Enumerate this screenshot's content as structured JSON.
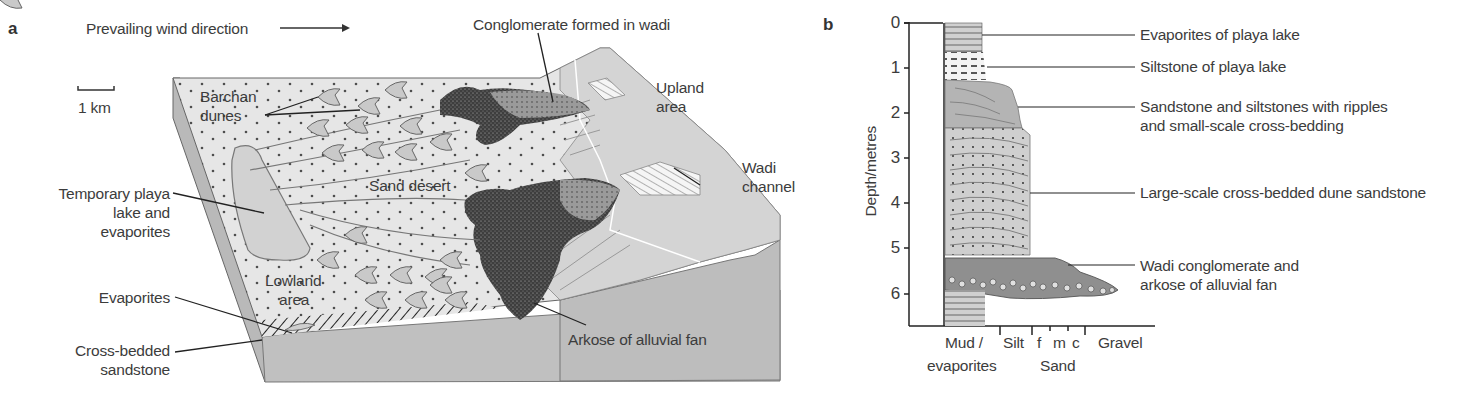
{
  "panel_a": {
    "letter": "a",
    "wind_label": "Prevailing wind direction",
    "scale_label": "1 km",
    "labels": {
      "barchan": [
        "Barchan",
        "dunes"
      ],
      "temporary_playa": [
        "Temporary playa",
        "lake and",
        "evaporites"
      ],
      "sand_desert": "Sand desert",
      "lowland": [
        "Lowland",
        "area"
      ],
      "evaporites": "Evaporites",
      "cross_bedded": [
        "Cross-bedded",
        "sandstone"
      ],
      "conglomerate": "Conglomerate formed in wadi",
      "upland": [
        "Upland",
        "area"
      ],
      "wadi_channel": [
        "Wadi",
        "channel"
      ],
      "arkose": "Arkose of alluvial fan"
    }
  },
  "panel_b": {
    "letter": "b",
    "ylabel": "Depth/metres",
    "depth_ticks": [
      "0",
      "1",
      "2",
      "3",
      "4",
      "5",
      "6"
    ],
    "grain_axis": {
      "mud": "Mud /",
      "evaporites": "evaporites",
      "silt": "Silt",
      "f": "f",
      "m": "m",
      "c": "c",
      "sand": "Sand",
      "gravel": "Gravel"
    },
    "units": [
      {
        "label": "Evaporites of playa lake",
        "top": 0,
        "base": 0.65
      },
      {
        "label": "Siltstone of playa lake",
        "top": 0.65,
        "base": 1.3
      },
      {
        "label": "Sandstone and siltstones with ripples",
        "label2": "and small-scale cross-bedding",
        "top": 1.3,
        "base": 2.35
      },
      {
        "label": "Large-scale cross-bedded dune sandstone",
        "top": 2.35,
        "base": 5.2
      },
      {
        "label": "Wadi conglomerate and",
        "label2": "arkose of alluvial fan",
        "top": 5.2,
        "base": 6.0
      }
    ]
  },
  "colors": {
    "sand_surface": "#e6e6e6",
    "side_face": "#b9b9b9",
    "front_face": "#c0c0c0",
    "arkose": "#474747",
    "playa": "#d2d2d2",
    "dune": "#c9c9c9",
    "text": "#3c3c3c"
  }
}
